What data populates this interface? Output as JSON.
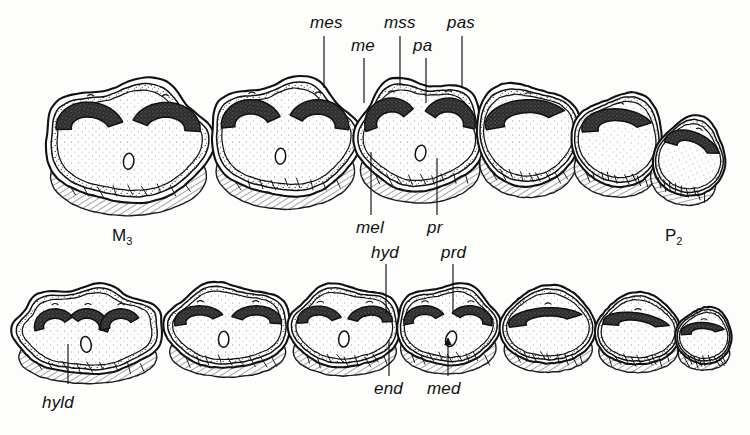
{
  "figure": {
    "kind": "scientific-line-illustration",
    "background_color": "#fdfdfc",
    "ink_color": "#111111"
  },
  "position_labels": [
    {
      "id": "m3",
      "text": "M",
      "sub": "3",
      "x": 112,
      "y": 226
    },
    {
      "id": "p2",
      "text": "P",
      "sub": "2",
      "x": 665,
      "y": 226
    }
  ],
  "anatomy_labels": [
    {
      "id": "mes",
      "text": "mes",
      "x": 310,
      "y": 13,
      "leader": {
        "x": 324,
        "y1": 36,
        "y2": 88
      },
      "arrow": false
    },
    {
      "id": "mss",
      "text": "mss",
      "x": 384,
      "y": 13,
      "leader": {
        "x": 400,
        "y1": 36,
        "y2": 86
      },
      "arrow": false
    },
    {
      "id": "pas",
      "text": "pas",
      "x": 447,
      "y": 13,
      "leader": {
        "x": 462,
        "y1": 36,
        "y2": 88
      },
      "arrow": false
    },
    {
      "id": "me",
      "text": "me",
      "x": 351,
      "y": 36,
      "leader": {
        "x": 364,
        "y1": 58,
        "y2": 103
      },
      "arrow": false
    },
    {
      "id": "pa",
      "text": "pa",
      "x": 413,
      "y": 36,
      "leader": {
        "x": 426,
        "y1": 58,
        "y2": 103
      },
      "arrow": false
    },
    {
      "id": "mel",
      "text": "mel",
      "x": 356,
      "y": 218,
      "leader": {
        "x": 371,
        "y1": 215,
        "y2": 152
      },
      "arrow": false
    },
    {
      "id": "pr",
      "text": "pr",
      "x": 427,
      "y": 218,
      "leader": {
        "x": 437,
        "y1": 215,
        "y2": 158
      },
      "arrow": false
    },
    {
      "id": "hyd",
      "text": "hyd",
      "x": 371,
      "y": 243,
      "leader": {
        "x": 386,
        "y1": 264,
        "y2": 314
      },
      "arrow": false
    },
    {
      "id": "prd",
      "text": "prd",
      "x": 441,
      "y": 243,
      "leader": {
        "x": 453,
        "y1": 264,
        "y2": 314
      },
      "arrow": false
    },
    {
      "id": "end",
      "text": "end",
      "x": 374,
      "y": 379,
      "leader": {
        "x": 389,
        "y1": 376,
        "y2": 340
      },
      "arrow": false
    },
    {
      "id": "med",
      "text": "med",
      "x": 427,
      "y": 379,
      "leader": {
        "x": 448,
        "y1": 376,
        "y2": 338
      },
      "arrow": true
    },
    {
      "id": "hyld",
      "text": "hyld",
      "x": 42,
      "y": 393,
      "leader": {
        "x": 68,
        "y1": 384,
        "y2": 344
      },
      "arrow": false
    }
  ],
  "upper_row": {
    "name": "upper-cheek-tooth-row",
    "teeth": [
      {
        "id": "upper-m3",
        "cx": 128,
        "cy": 142,
        "w": 170,
        "h": 120,
        "lobes": 2,
        "tilt": 0
      },
      {
        "id": "upper-m2",
        "cx": 285,
        "cy": 138,
        "w": 150,
        "h": 116,
        "lobes": 2,
        "tilt": 0
      },
      {
        "id": "upper-m1",
        "cx": 420,
        "cy": 135,
        "w": 130,
        "h": 112,
        "lobes": 2,
        "tilt": 0
      },
      {
        "id": "upper-p4",
        "cx": 528,
        "cy": 134,
        "w": 104,
        "h": 104,
        "lobes": 1,
        "tilt": 0
      },
      {
        "id": "upper-p3",
        "cx": 618,
        "cy": 140,
        "w": 90,
        "h": 94,
        "lobes": 1,
        "tilt": 4
      },
      {
        "id": "upper-p2",
        "cx": 690,
        "cy": 158,
        "w": 72,
        "h": 78,
        "lobes": 1,
        "tilt": 18
      }
    ]
  },
  "lower_row": {
    "name": "lower-cheek-tooth-row",
    "teeth": [
      {
        "id": "lower-m3",
        "cx": 88,
        "cy": 330,
        "w": 150,
        "h": 88,
        "lobes": 3,
        "tilt": 0
      },
      {
        "id": "lower-m2",
        "cx": 228,
        "cy": 326,
        "w": 126,
        "h": 84,
        "lobes": 2,
        "tilt": 0
      },
      {
        "id": "lower-m1",
        "cx": 345,
        "cy": 326,
        "w": 112,
        "h": 82,
        "lobes": 2,
        "tilt": 0
      },
      {
        "id": "lower-p4",
        "cx": 448,
        "cy": 325,
        "w": 104,
        "h": 80,
        "lobes": 2,
        "tilt": 0
      },
      {
        "id": "lower-p3",
        "cx": 548,
        "cy": 326,
        "w": 96,
        "h": 76,
        "lobes": 1,
        "tilt": 0
      },
      {
        "id": "lower-p2",
        "cx": 638,
        "cy": 330,
        "w": 86,
        "h": 70,
        "lobes": 1,
        "tilt": 0
      },
      {
        "id": "lower-p1",
        "cx": 704,
        "cy": 336,
        "w": 56,
        "h": 56,
        "lobes": 1,
        "tilt": 0
      }
    ]
  }
}
